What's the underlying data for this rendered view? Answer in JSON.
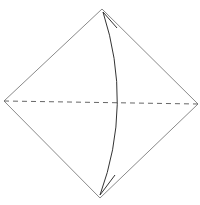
{
  "diagram": {
    "type": "origami-fold-step",
    "background": "#ffffff",
    "paper": {
      "shape": "square-diamond",
      "stroke": "#8a8a8a",
      "points": "102,9 198,104 100,198 4,101"
    },
    "fold_line": {
      "style": "dashed",
      "kind": "valley-fold",
      "stroke": "#666666",
      "x1": 4,
      "y1": 101,
      "x2": 198,
      "y2": 104
    },
    "arrow": {
      "kind": "fold-and-unfold",
      "stroke": "#333333",
      "path": "M103,12 Q133,105 100,195",
      "head_top": "M103,12 L117,28",
      "head_bottom": "M100,195 L115,175"
    }
  }
}
